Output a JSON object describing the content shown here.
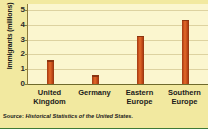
{
  "chart_data": {
    "type": "bar",
    "title": "",
    "xlabel": "",
    "ylabel": "Immigrants (millions)",
    "categories": [
      "United Kingdom",
      "Germany",
      "Eastern Europe",
      "Southern Europe"
    ],
    "category_lines": [
      [
        "United",
        "Kingdom"
      ],
      [
        "Germany"
      ],
      [
        "Eastern",
        "Europe"
      ],
      [
        "Southern",
        "Europe"
      ]
    ],
    "values": [
      1.6,
      0.6,
      3.25,
      4.35
    ],
    "ylim": [
      0,
      5.4
    ],
    "yticks": [
      0,
      1,
      2,
      3,
      4,
      5
    ],
    "ytick_labels": [
      "0",
      "1",
      "2",
      "3",
      "4",
      "5"
    ],
    "grid": true,
    "legend": false,
    "bar_color": "#c24a18",
    "plot_background": "#fbf6cf",
    "figure_background": "#f2e9a0",
    "rule_color": "#3f7a36"
  },
  "source": {
    "label": "Source:",
    "text": "Historical Statistics of the United States."
  }
}
